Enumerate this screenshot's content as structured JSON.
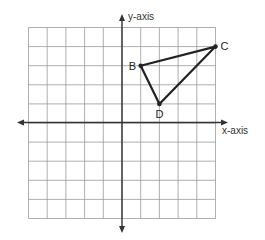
{
  "diagram": {
    "type": "coordinate-plane",
    "grid": {
      "x_min": -5,
      "x_max": 5,
      "y_min": -5,
      "y_max": 5
    },
    "axes": {
      "x_label": "x-axis",
      "y_label": "y-axis"
    },
    "points": [
      {
        "name": "B",
        "x": 1,
        "y": 3
      },
      {
        "name": "C",
        "x": 5,
        "y": 4
      },
      {
        "name": "D",
        "x": 2,
        "y": 1
      }
    ],
    "polygon": [
      "B",
      "C",
      "D"
    ],
    "colors": {
      "grid": "#9a9a9a",
      "axis": "#333333",
      "shape": "#222222"
    }
  }
}
